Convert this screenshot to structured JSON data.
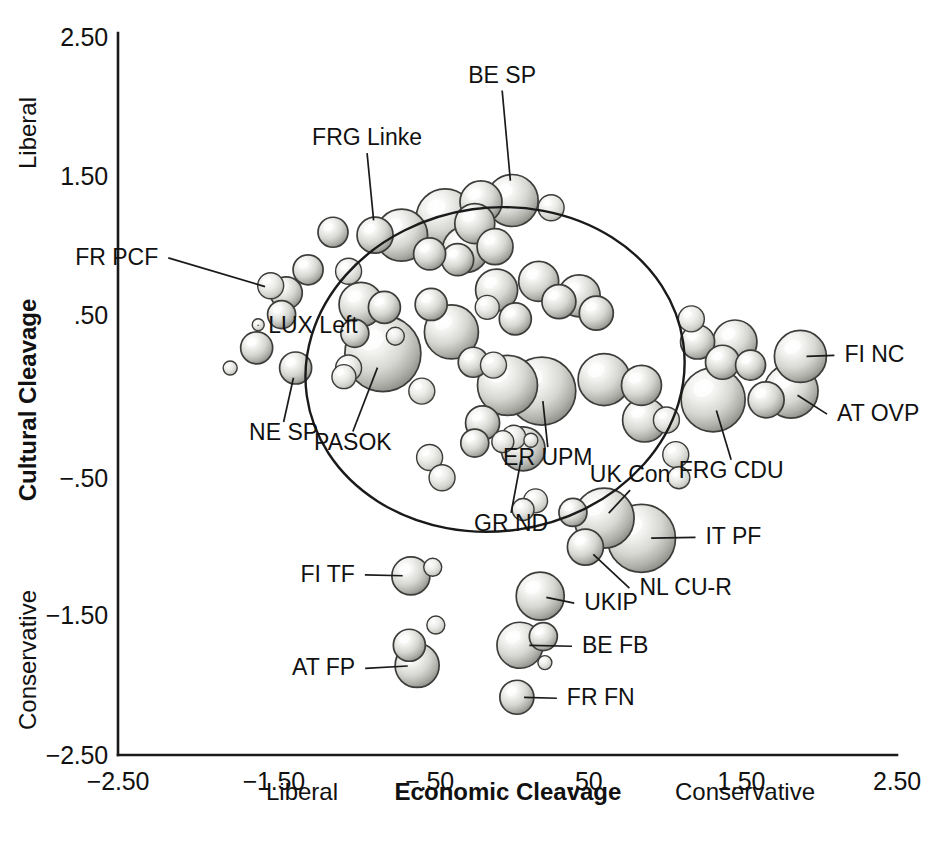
{
  "chart_data": {
    "type": "scatter",
    "title": "",
    "xlabel": "Economic Cleavage",
    "ylabel": "Cultural Cleavage",
    "xlim": [
      -2.5,
      2.5
    ],
    "ylim": [
      -2.5,
      2.5
    ],
    "grid": false,
    "legend": "none",
    "xticks": [
      "-2.50",
      "-1.50",
      "-.50",
      ".50",
      "1.50",
      "2.50"
    ],
    "xtickvalues": [
      -2.5,
      -1.5,
      -0.5,
      0.5,
      1.5,
      2.5
    ],
    "yticks": [
      "2.50",
      "1.50",
      ".50",
      "-.50",
      "-1.50",
      "-2.50"
    ],
    "ytickvalues": [
      2.5,
      1.5,
      0.5,
      -0.5,
      -1.5,
      -2.5
    ],
    "x_axis_pole_low": "Liberal",
    "x_axis_pole_high": "Conservative",
    "y_axis_pole_high": "Liberal",
    "y_axis_pole_low": "Conservative",
    "marker_style": "shaded-sphere-bubble",
    "size_encoding": "party vote share / size",
    "annotation_shape": "ellipse",
    "annotation_ellipse": {
      "cx": -0.08,
      "cy": 0.17,
      "rx": 1.22,
      "ry": 1.12,
      "rotation_deg": -8
    },
    "points": [
      {
        "label": "BE SP",
        "x": 0.03,
        "y": 1.34,
        "r": 26,
        "labeled": true,
        "label_dx": -10,
        "label_dy": -118,
        "anchor": "middle"
      },
      {
        "label": "FRG Linke",
        "x": -0.85,
        "y": 1.1,
        "r": 18,
        "labeled": true,
        "label_dx": -8,
        "label_dy": -90,
        "anchor": "middle"
      },
      {
        "label": "FR PCF",
        "x": -1.42,
        "y": 0.7,
        "r": 16,
        "labeled": true,
        "label_dx": -128,
        "label_dy": -28,
        "anchor": "end"
      },
      {
        "label": "LUX Left",
        "x": -1.6,
        "y": 0.48,
        "r": 6,
        "labeled": true,
        "label_dx": 10,
        "label_dy": 8,
        "anchor": "start"
      },
      {
        "label": "NE SP",
        "x": -1.36,
        "y": 0.18,
        "r": 16,
        "labeled": true,
        "label_dx": -12,
        "label_dy": 72,
        "anchor": "middle"
      },
      {
        "label": "PASOK",
        "x": -0.8,
        "y": 0.28,
        "r": 38,
        "labeled": true,
        "label_dx": -30,
        "label_dy": 96,
        "anchor": "middle"
      },
      {
        "label": "ER UPM",
        "x": 0.22,
        "y": 0.02,
        "r": 34,
        "labeled": true,
        "label_dx": 6,
        "label_dy": 74,
        "anchor": "middle"
      },
      {
        "label": "FI NC",
        "x": 1.88,
        "y": 0.26,
        "r": 26,
        "labeled": true,
        "label_dx": 44,
        "label_dy": 6,
        "anchor": "start"
      },
      {
        "label": "AT OVP",
        "x": 1.82,
        "y": 0.02,
        "r": 27,
        "labeled": true,
        "label_dx": 46,
        "label_dy": 30,
        "anchor": "start"
      },
      {
        "label": "FRG CDU",
        "x": 1.32,
        "y": -0.04,
        "r": 32,
        "labeled": true,
        "label_dx": 18,
        "label_dy": 78,
        "anchor": "middle"
      },
      {
        "label": "GR ND",
        "x": 0.1,
        "y": -0.38,
        "r": 22,
        "labeled": true,
        "label_dx": -12,
        "label_dy": 82,
        "anchor": "middle"
      },
      {
        "label": "UK Con",
        "x": 0.62,
        "y": -0.86,
        "r": 30,
        "labeled": true,
        "label_dx": 26,
        "label_dy": -36,
        "anchor": "middle"
      },
      {
        "label": "IT PF",
        "x": 0.86,
        "y": -1.0,
        "r": 34,
        "labeled": true,
        "label_dx": 64,
        "label_dy": 6,
        "anchor": "start"
      },
      {
        "label": "NL CU-R",
        "x": 0.5,
        "y": -1.06,
        "r": 18,
        "labeled": true,
        "label_dx": 54,
        "label_dy": 48,
        "anchor": "start"
      },
      {
        "label": "UKIP",
        "x": 0.21,
        "y": -1.4,
        "r": 24,
        "labeled": true,
        "label_dx": 44,
        "label_dy": 14,
        "anchor": "start"
      },
      {
        "label": "BE FB",
        "x": 0.08,
        "y": -1.74,
        "r": 23,
        "labeled": true,
        "label_dx": 62,
        "label_dy": 8,
        "anchor": "start"
      },
      {
        "label": "FI TF",
        "x": -0.62,
        "y": -1.26,
        "r": 19,
        "labeled": true,
        "label_dx": -56,
        "label_dy": 6,
        "anchor": "end"
      },
      {
        "label": "AT FP",
        "x": -0.58,
        "y": -1.88,
        "r": 22,
        "labeled": true,
        "label_dx": -62,
        "label_dy": 10,
        "anchor": "end"
      },
      {
        "label": "FR FN",
        "x": 0.06,
        "y": -2.1,
        "r": 17,
        "labeled": true,
        "label_dx": 50,
        "label_dy": 8,
        "anchor": "start"
      },
      {
        "label": "",
        "x": -1.12,
        "y": 1.12,
        "r": 15,
        "labeled": false
      },
      {
        "label": "",
        "x": -0.68,
        "y": 1.1,
        "r": 26,
        "labeled": false
      },
      {
        "label": "",
        "x": -0.4,
        "y": 1.22,
        "r": 29,
        "labeled": false
      },
      {
        "label": "",
        "x": -0.21,
        "y": 1.18,
        "r": 20,
        "labeled": false
      },
      {
        "label": "",
        "x": -0.17,
        "y": 1.33,
        "r": 21,
        "labeled": false
      },
      {
        "label": "",
        "x": 0.28,
        "y": 1.29,
        "r": 13,
        "labeled": false
      },
      {
        "label": "",
        "x": -0.27,
        "y": 1.0,
        "r": 23,
        "labeled": false
      },
      {
        "label": "",
        "x": -0.32,
        "y": 0.93,
        "r": 16,
        "labeled": false
      },
      {
        "label": "",
        "x": -0.08,
        "y": 1.02,
        "r": 18,
        "labeled": false
      },
      {
        "label": "",
        "x": -0.5,
        "y": 0.97,
        "r": 16,
        "labeled": false
      },
      {
        "label": "",
        "x": -1.28,
        "y": 0.86,
        "r": 15,
        "labeled": false
      },
      {
        "label": "",
        "x": -1.52,
        "y": 0.75,
        "r": 13,
        "labeled": false
      },
      {
        "label": "",
        "x": -1.45,
        "y": 0.55,
        "r": 14,
        "labeled": false
      },
      {
        "label": "",
        "x": -1.02,
        "y": 0.85,
        "r": 13,
        "labeled": false
      },
      {
        "label": "",
        "x": -0.94,
        "y": 0.62,
        "r": 22,
        "labeled": false
      },
      {
        "label": "",
        "x": -0.79,
        "y": 0.6,
        "r": 16,
        "labeled": false
      },
      {
        "label": "",
        "x": -1.61,
        "y": 0.32,
        "r": 16,
        "labeled": false
      },
      {
        "label": "",
        "x": -1.78,
        "y": 0.18,
        "r": 7,
        "labeled": false
      },
      {
        "label": "",
        "x": -0.98,
        "y": 0.42,
        "r": 14,
        "labeled": false
      },
      {
        "label": "",
        "x": -1.02,
        "y": 0.18,
        "r": 13,
        "labeled": false
      },
      {
        "label": "",
        "x": -1.05,
        "y": 0.12,
        "r": 12,
        "labeled": false
      },
      {
        "label": "",
        "x": -0.72,
        "y": 0.4,
        "r": 9,
        "labeled": false
      },
      {
        "label": "",
        "x": -0.49,
        "y": 0.62,
        "r": 16,
        "labeled": false
      },
      {
        "label": "",
        "x": -0.36,
        "y": 0.43,
        "r": 27,
        "labeled": false
      },
      {
        "label": "",
        "x": -0.55,
        "y": 0.02,
        "r": 13,
        "labeled": false
      },
      {
        "label": "",
        "x": -0.5,
        "y": -0.44,
        "r": 13,
        "labeled": false
      },
      {
        "label": "",
        "x": -0.07,
        "y": 0.72,
        "r": 21,
        "labeled": false
      },
      {
        "label": "",
        "x": 0.2,
        "y": 0.78,
        "r": 20,
        "labeled": false
      },
      {
        "label": "",
        "x": 0.33,
        "y": 0.64,
        "r": 17,
        "labeled": false
      },
      {
        "label": "",
        "x": 0.46,
        "y": 0.68,
        "r": 21,
        "labeled": false
      },
      {
        "label": "",
        "x": 0.57,
        "y": 0.56,
        "r": 17,
        "labeled": false
      },
      {
        "label": "",
        "x": 0.05,
        "y": 0.52,
        "r": 16,
        "labeled": false
      },
      {
        "label": "",
        "x": -0.13,
        "y": 0.6,
        "r": 12,
        "labeled": false
      },
      {
        "label": "",
        "x": -0.22,
        "y": 0.22,
        "r": 15,
        "labeled": false
      },
      {
        "label": "",
        "x": -0.09,
        "y": 0.2,
        "r": 13,
        "labeled": false
      },
      {
        "label": "",
        "x": 0.0,
        "y": 0.06,
        "r": 30,
        "labeled": false
      },
      {
        "label": "",
        "x": 0.62,
        "y": 0.1,
        "r": 26,
        "labeled": false
      },
      {
        "label": "",
        "x": 0.86,
        "y": 0.06,
        "r": 20,
        "labeled": false
      },
      {
        "label": "",
        "x": 0.88,
        "y": -0.18,
        "r": 22,
        "labeled": false
      },
      {
        "label": "",
        "x": -0.16,
        "y": -0.2,
        "r": 17,
        "labeled": false
      },
      {
        "label": "",
        "x": -0.21,
        "y": -0.34,
        "r": 14,
        "labeled": false
      },
      {
        "label": "",
        "x": 0.04,
        "y": -0.3,
        "r": 12,
        "labeled": false
      },
      {
        "label": "",
        "x": -0.03,
        "y": -0.33,
        "r": 11,
        "labeled": false
      },
      {
        "label": "",
        "x": 0.15,
        "y": -0.32,
        "r": 7,
        "labeled": false
      },
      {
        "label": "",
        "x": -0.42,
        "y": -0.58,
        "r": 13,
        "labeled": false
      },
      {
        "label": "",
        "x": 1.18,
        "y": 0.52,
        "r": 13,
        "labeled": false
      },
      {
        "label": "",
        "x": 1.22,
        "y": 0.36,
        "r": 17,
        "labeled": false
      },
      {
        "label": "",
        "x": 1.46,
        "y": 0.36,
        "r": 22,
        "labeled": false
      },
      {
        "label": "",
        "x": 1.38,
        "y": 0.22,
        "r": 17,
        "labeled": false
      },
      {
        "label": "",
        "x": 1.56,
        "y": 0.2,
        "r": 15,
        "labeled": false
      },
      {
        "label": "",
        "x": 1.02,
        "y": -0.18,
        "r": 13,
        "labeled": false
      },
      {
        "label": "",
        "x": 1.66,
        "y": -0.04,
        "r": 18,
        "labeled": false
      },
      {
        "label": "",
        "x": 1.08,
        "y": -0.42,
        "r": 13,
        "labeled": false
      },
      {
        "label": "",
        "x": 1.1,
        "y": -0.58,
        "r": 11,
        "labeled": false
      },
      {
        "label": "",
        "x": 0.18,
        "y": -0.74,
        "r": 12,
        "labeled": false
      },
      {
        "label": "",
        "x": 0.1,
        "y": -0.8,
        "r": 11,
        "labeled": false
      },
      {
        "label": "",
        "x": 0.42,
        "y": -0.82,
        "r": 14,
        "labeled": false
      },
      {
        "label": "",
        "x": -0.48,
        "y": -1.2,
        "r": 9,
        "labeled": false
      },
      {
        "label": "",
        "x": -0.46,
        "y": -1.6,
        "r": 9,
        "labeled": false
      },
      {
        "label": "",
        "x": -0.63,
        "y": -1.74,
        "r": 16,
        "labeled": false
      },
      {
        "label": "",
        "x": 0.23,
        "y": -1.68,
        "r": 14,
        "labeled": false
      },
      {
        "label": "",
        "x": 0.24,
        "y": -1.86,
        "r": 7,
        "labeled": false
      }
    ]
  },
  "axes": {
    "x": {
      "title": "Economic Cleavage",
      "pole_low": "Liberal",
      "pole_high": "Conservative",
      "ticks": [
        "-2.50",
        "-1.50",
        "-.50",
        ".50",
        "1.50",
        "2.50"
      ]
    },
    "y": {
      "title": "Cultural Cleavage",
      "pole_high": "Liberal",
      "pole_low": "Conservative",
      "ticks": [
        "2.50",
        "1.50",
        ".50",
        "-.50",
        "-1.50",
        "-2.50"
      ]
    }
  },
  "colors": {
    "background": "#ffffff",
    "ink": "#111111",
    "bubble_light": "#f4f4f2",
    "bubble_mid": "#c8c8c4",
    "bubble_dark": "#8d8d89",
    "bubble_edge": "#3a3a38"
  }
}
